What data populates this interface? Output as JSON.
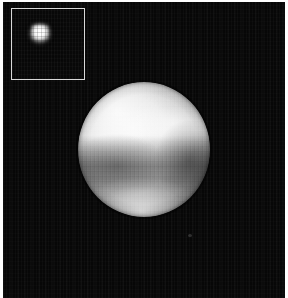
{
  "figure": {
    "instrument": "Hubble Space Telescope",
    "background_color": "#070707",
    "border_color": "#d8d8d8",
    "canvas": {
      "width": 288,
      "height": 298
    }
  },
  "inset": {
    "name": "raw-frame-inset",
    "description": "Low resolution unprocessed frame of Pluto",
    "border_color": "#d8d8d8",
    "background_color": "#080808",
    "blob": {
      "name": "pluto-raw-blob",
      "description": "Blurred pixelated bright blob",
      "peak_color": "#ffffff"
    }
  },
  "disk": {
    "name": "pluto-disk",
    "description": "Deconvolved disk of Pluto with surface albedo features",
    "features": [
      {
        "name": "bright-northwest-limb",
        "type": "bright",
        "description": "Bright region on the upper-left limb"
      },
      {
        "name": "bright-equatorial-band",
        "type": "bright",
        "description": "Bright band sweeping across the upper middle"
      },
      {
        "name": "bright-northeast-patch",
        "type": "bright",
        "description": "Bright knot on the upper-right"
      },
      {
        "name": "dark-midlatitude-band",
        "type": "dark",
        "description": "Dark band across the middle of the disk"
      },
      {
        "name": "dark-southwest-patch",
        "type": "dark",
        "description": "Darker blotch on the lower-left"
      },
      {
        "name": "dark-east-patch",
        "type": "dark",
        "description": "Darker blotch on the right flank"
      },
      {
        "name": "bright-south-polar-cap",
        "type": "bright",
        "description": "Bright polar cap at the bottom"
      }
    ],
    "bright_color": "#ffffff",
    "mid_color": "#9c9c9c",
    "dark_color": "#151515"
  },
  "background": {
    "speck": {
      "name": "background-speck",
      "description": "Faint speck in the dark field below and right of the disk"
    }
  }
}
